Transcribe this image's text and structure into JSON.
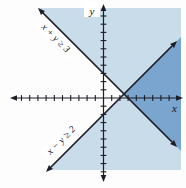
{
  "figure": {
    "line1_label": "x + y ≥ 3",
    "line2_label": "x − y ≥ 2",
    "x_axis_label": "x",
    "y_axis_label": "y"
  },
  "colors": {
    "background": "#fdfdfd",
    "region_light": "#c9dcea",
    "region_dark": "#79a5ce",
    "ink": "#1d1d27",
    "label_bg": "#ffffff"
  },
  "chart_data": {
    "type": "line",
    "title": "",
    "xlabel": "x",
    "ylabel": "y",
    "x_range": [
      -10,
      8
    ],
    "y_range": [
      -9,
      10
    ],
    "tick_interval": 1,
    "grid": false,
    "legend": "none",
    "series": [
      {
        "name": "x + y ≥ 3",
        "boundary_equation": "x + y = 3",
        "slope": -1,
        "y_intercept": 3,
        "x_intercept": 3,
        "boundary_style": "solid",
        "shaded_side": "above-right of line"
      },
      {
        "name": "x − y ≥ 2",
        "boundary_equation": "x − y = 2",
        "slope": 1,
        "y_intercept": -2,
        "x_intercept": 2,
        "boundary_style": "solid",
        "shaded_side": "below-right of line"
      }
    ],
    "intersection_point": {
      "x": 2.5,
      "y": 0.5
    },
    "regions": {
      "light_blue": "points satisfying exactly one of the two inequalities",
      "dark_blue": "solution region satisfying both inequalities; wedge opening rightward from (2.5, 0.5)",
      "white": "points satisfying neither inequality (wedge opening leftward)"
    }
  }
}
